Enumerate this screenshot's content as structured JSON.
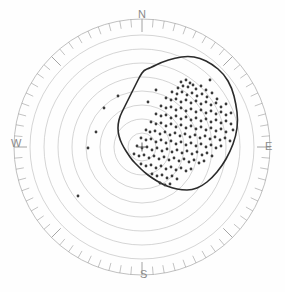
{
  "figure": {
    "title": "",
    "kind": "polar-scatter-with-contour",
    "background_color": "#fefefe",
    "size": {
      "width": 285,
      "height": 292
    }
  },
  "compass": {
    "north_label": "N",
    "east_label": "E",
    "south_label": "S",
    "west_label": "W",
    "label_color": "#8a8a8a"
  },
  "chart_data": {
    "type": "scatter",
    "title": "",
    "xlabel": "",
    "ylabel": "",
    "projection": "polar",
    "grid": true,
    "legend": "none",
    "center": {
      "x": 142,
      "y": 147
    },
    "outer_radius": 128,
    "ring_count": 9,
    "ring_radii": [
      14,
      28,
      42,
      56,
      70,
      84,
      98,
      112,
      128
    ],
    "ring_color": "#b9b9b9",
    "ring_width": 0.6,
    "tick_ring": {
      "inner_radius": 118,
      "outer_radius": 128,
      "minor_count": 72,
      "major_every": 9,
      "color": "#9a9a9a"
    },
    "center_marker": {
      "symbol": "plus",
      "size": 9,
      "color": "#555555"
    },
    "contour": {
      "name": "coverage-contour",
      "color": "#2b2b2b",
      "width": 1.6,
      "closed": true,
      "points_polar_deg_r": [
        [
          96,
          78
        ],
        [
          86,
          82
        ],
        [
          76,
          84
        ],
        [
          66,
          86
        ],
        [
          58,
          88
        ],
        [
          50,
          92
        ],
        [
          42,
          96
        ],
        [
          34,
          98
        ],
        [
          26,
          96
        ],
        [
          18,
          92
        ],
        [
          10,
          86
        ],
        [
          2,
          80
        ],
        [
          -6,
          76
        ],
        [
          -14,
          72
        ],
        [
          -22,
          68
        ],
        [
          -30,
          66
        ],
        [
          -38,
          64
        ],
        [
          -46,
          62
        ],
        [
          -54,
          58
        ],
        [
          -62,
          52
        ],
        [
          -70,
          46
        ],
        [
          -78,
          40
        ],
        [
          -86,
          34
        ],
        [
          -96,
          28
        ],
        [
          -108,
          24
        ],
        [
          -122,
          22
        ],
        [
          -138,
          24
        ],
        [
          -152,
          28
        ],
        [
          -166,
          32
        ],
        [
          178,
          34
        ],
        [
          166,
          34
        ],
        [
          154,
          30
        ],
        [
          142,
          24
        ],
        [
          130,
          20
        ],
        [
          118,
          26
        ],
        [
          108,
          46
        ],
        [
          102,
          64
        ]
      ],
      "points_xy": [
        [
          150,
          68
        ],
        [
          162,
          62
        ],
        [
          175,
          58
        ],
        [
          188,
          56
        ],
        [
          200,
          58
        ],
        [
          212,
          64
        ],
        [
          224,
          74
        ],
        [
          232,
          88
        ],
        [
          236,
          104
        ],
        [
          238,
          120
        ],
        [
          236,
          136
        ],
        [
          230,
          152
        ],
        [
          222,
          166
        ],
        [
          212,
          178
        ],
        [
          202,
          186
        ],
        [
          192,
          190
        ],
        [
          182,
          190
        ],
        [
          172,
          188
        ],
        [
          162,
          184
        ],
        [
          152,
          178
        ],
        [
          144,
          172
        ],
        [
          138,
          166
        ],
        [
          132,
          160
        ],
        [
          128,
          154
        ],
        [
          124,
          148
        ],
        [
          120,
          140
        ],
        [
          118,
          132
        ],
        [
          118,
          124
        ],
        [
          120,
          116
        ],
        [
          124,
          108
        ],
        [
          128,
          100
        ],
        [
          132,
          92
        ],
        [
          136,
          84
        ],
        [
          140,
          76
        ],
        [
          144,
          70
        ]
      ]
    },
    "points": {
      "name": "event-scatter",
      "color": "#3a3a3a",
      "size": 1.4,
      "count": 168,
      "xy": [
        [
          181,
          82
        ],
        [
          186,
          80
        ],
        [
          190,
          83
        ],
        [
          183,
          86
        ],
        [
          188,
          87
        ],
        [
          193,
          85
        ],
        [
          178,
          88
        ],
        [
          196,
          89
        ],
        [
          201,
          86
        ],
        [
          206,
          90
        ],
        [
          172,
          92
        ],
        [
          177,
          94
        ],
        [
          182,
          92
        ],
        [
          187,
          95
        ],
        [
          192,
          93
        ],
        [
          197,
          96
        ],
        [
          202,
          94
        ],
        [
          207,
          97
        ],
        [
          212,
          93
        ],
        [
          217,
          99
        ],
        [
          166,
          98
        ],
        [
          171,
          100
        ],
        [
          176,
          99
        ],
        [
          181,
          102
        ],
        [
          186,
          100
        ],
        [
          191,
          103
        ],
        [
          196,
          101
        ],
        [
          201,
          104
        ],
        [
          206,
          102
        ],
        [
          211,
          105
        ],
        [
          216,
          103
        ],
        [
          221,
          107
        ],
        [
          226,
          104
        ],
        [
          161,
          106
        ],
        [
          166,
          108
        ],
        [
          171,
          107
        ],
        [
          176,
          110
        ],
        [
          181,
          108
        ],
        [
          186,
          111
        ],
        [
          191,
          109
        ],
        [
          196,
          112
        ],
        [
          201,
          110
        ],
        [
          206,
          113
        ],
        [
          211,
          111
        ],
        [
          216,
          114
        ],
        [
          221,
          112
        ],
        [
          226,
          115
        ],
        [
          231,
          113
        ],
        [
          156,
          114
        ],
        [
          161,
          116
        ],
        [
          166,
          115
        ],
        [
          171,
          118
        ],
        [
          176,
          116
        ],
        [
          181,
          119
        ],
        [
          186,
          117
        ],
        [
          191,
          120
        ],
        [
          196,
          118
        ],
        [
          201,
          121
        ],
        [
          206,
          119
        ],
        [
          211,
          122
        ],
        [
          216,
          120
        ],
        [
          221,
          123
        ],
        [
          226,
          121
        ],
        [
          231,
          124
        ],
        [
          151,
          122
        ],
        [
          156,
          124
        ],
        [
          161,
          123
        ],
        [
          166,
          126
        ],
        [
          171,
          124
        ],
        [
          176,
          127
        ],
        [
          181,
          125
        ],
        [
          186,
          128
        ],
        [
          191,
          126
        ],
        [
          196,
          129
        ],
        [
          201,
          127
        ],
        [
          206,
          130
        ],
        [
          211,
          128
        ],
        [
          216,
          131
        ],
        [
          221,
          129
        ],
        [
          226,
          132
        ],
        [
          233,
          130
        ],
        [
          146,
          130
        ],
        [
          150,
          132
        ],
        [
          155,
          131
        ],
        [
          160,
          134
        ],
        [
          165,
          132
        ],
        [
          170,
          135
        ],
        [
          175,
          133
        ],
        [
          180,
          136
        ],
        [
          185,
          134
        ],
        [
          190,
          137
        ],
        [
          195,
          135
        ],
        [
          200,
          138
        ],
        [
          205,
          136
        ],
        [
          210,
          139
        ],
        [
          215,
          137
        ],
        [
          220,
          140
        ],
        [
          225,
          138
        ],
        [
          230,
          141
        ],
        [
          141,
          138
        ],
        [
          146,
          140
        ],
        [
          151,
          139
        ],
        [
          156,
          142
        ],
        [
          161,
          140
        ],
        [
          166,
          143
        ],
        [
          171,
          141
        ],
        [
          176,
          144
        ],
        [
          181,
          142
        ],
        [
          186,
          145
        ],
        [
          191,
          143
        ],
        [
          196,
          146
        ],
        [
          201,
          144
        ],
        [
          206,
          147
        ],
        [
          211,
          145
        ],
        [
          216,
          148
        ],
        [
          221,
          146
        ],
        [
          137,
          146
        ],
        [
          142,
          148
        ],
        [
          147,
          147
        ],
        [
          152,
          150
        ],
        [
          157,
          148
        ],
        [
          162,
          151
        ],
        [
          167,
          149
        ],
        [
          172,
          152
        ],
        [
          177,
          150
        ],
        [
          182,
          153
        ],
        [
          187,
          151
        ],
        [
          192,
          154
        ],
        [
          197,
          152
        ],
        [
          202,
          155
        ],
        [
          207,
          153
        ],
        [
          212,
          156
        ],
        [
          134,
          154
        ],
        [
          139,
          156
        ],
        [
          144,
          155
        ],
        [
          149,
          158
        ],
        [
          154,
          156
        ],
        [
          159,
          159
        ],
        [
          164,
          157
        ],
        [
          169,
          160
        ],
        [
          174,
          158
        ],
        [
          179,
          161
        ],
        [
          184,
          159
        ],
        [
          189,
          162
        ],
        [
          194,
          160
        ],
        [
          199,
          163
        ],
        [
          204,
          161
        ],
        [
          141,
          164
        ],
        [
          146,
          166
        ],
        [
          151,
          165
        ],
        [
          156,
          168
        ],
        [
          161,
          166
        ],
        [
          166,
          169
        ],
        [
          171,
          167
        ],
        [
          176,
          170
        ],
        [
          181,
          168
        ],
        [
          186,
          171
        ],
        [
          191,
          169
        ],
        [
          152,
          174
        ],
        [
          157,
          176
        ],
        [
          162,
          175
        ],
        [
          167,
          178
        ],
        [
          172,
          176
        ],
        [
          177,
          179
        ],
        [
          160,
          183
        ],
        [
          165,
          185
        ],
        [
          170,
          184
        ],
        [
          104,
          108
        ],
        [
          118,
          96
        ],
        [
          96,
          132
        ],
        [
          88,
          148
        ],
        [
          78,
          196
        ],
        [
          148,
          102
        ],
        [
          156,
          90
        ],
        [
          210,
          80
        ]
      ]
    }
  }
}
